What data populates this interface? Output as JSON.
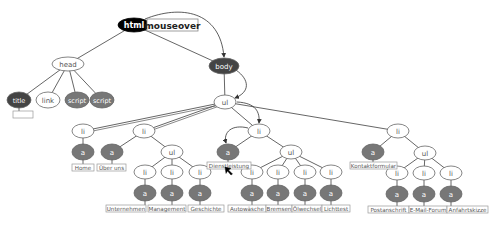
{
  "diagram": {
    "event_label": "mouseover",
    "colors": {
      "black": "#000000",
      "dark": "#444444",
      "medium": "#777777",
      "light": "#ffffff",
      "stroke": "#555555",
      "label_border": "#999999",
      "label_text": "#555555"
    },
    "nodes": [
      {
        "id": "html",
        "label": "html",
        "x": 134,
        "y": 25,
        "rx": 16,
        "ry": 7,
        "fill": "black"
      },
      {
        "id": "head",
        "label": "head",
        "x": 68,
        "y": 64,
        "rx": 16,
        "ry": 7,
        "fill": "light"
      },
      {
        "id": "body",
        "label": "body",
        "x": 224,
        "y": 66,
        "rx": 15,
        "ry": 8,
        "fill": "dark"
      },
      {
        "id": "title",
        "label": "title",
        "x": 19,
        "y": 100,
        "rx": 12,
        "ry": 8,
        "fill": "dark"
      },
      {
        "id": "link",
        "label": "link",
        "x": 48,
        "y": 100,
        "rx": 12,
        "ry": 8,
        "fill": "light"
      },
      {
        "id": "script1",
        "label": "script",
        "x": 77,
        "y": 100,
        "rx": 12,
        "ry": 8,
        "fill": "medium"
      },
      {
        "id": "script2",
        "label": "script",
        "x": 102,
        "y": 100,
        "rx": 12,
        "ry": 8,
        "fill": "medium"
      },
      {
        "id": "ul0",
        "label": "ul",
        "x": 225,
        "y": 102,
        "rx": 11,
        "ry": 7,
        "fill": "light"
      },
      {
        "id": "li1",
        "label": "li",
        "x": 83,
        "y": 131,
        "rx": 11,
        "ry": 7,
        "fill": "light"
      },
      {
        "id": "li2",
        "label": "li",
        "x": 144,
        "y": 131,
        "rx": 11,
        "ry": 7,
        "fill": "light"
      },
      {
        "id": "li3",
        "label": "li",
        "x": 259,
        "y": 131,
        "rx": 11,
        "ry": 7,
        "fill": "light"
      },
      {
        "id": "li4",
        "label": "li",
        "x": 398,
        "y": 131,
        "rx": 11,
        "ry": 7,
        "fill": "light"
      },
      {
        "id": "a_home",
        "label": "a",
        "x": 83,
        "y": 152,
        "rx": 11,
        "ry": 8,
        "fill": "medium"
      },
      {
        "id": "a_ueber",
        "label": "a",
        "x": 112,
        "y": 152,
        "rx": 11,
        "ry": 8,
        "fill": "medium"
      },
      {
        "id": "ul2",
        "label": "ul",
        "x": 172,
        "y": 152,
        "rx": 11,
        "ry": 7,
        "fill": "light"
      },
      {
        "id": "li2a",
        "label": "li",
        "x": 145,
        "y": 172,
        "rx": 11,
        "ry": 7,
        "fill": "light"
      },
      {
        "id": "li2b",
        "label": "li",
        "x": 172,
        "y": 172,
        "rx": 11,
        "ry": 7,
        "fill": "light"
      },
      {
        "id": "li2c",
        "label": "li",
        "x": 200,
        "y": 172,
        "rx": 11,
        "ry": 7,
        "fill": "light"
      },
      {
        "id": "a2a",
        "label": "a",
        "x": 145,
        "y": 193,
        "rx": 11,
        "ry": 8,
        "fill": "medium"
      },
      {
        "id": "a2b",
        "label": "a",
        "x": 172,
        "y": 193,
        "rx": 11,
        "ry": 8,
        "fill": "medium"
      },
      {
        "id": "a2c",
        "label": "a",
        "x": 200,
        "y": 193,
        "rx": 11,
        "ry": 8,
        "fill": "medium"
      },
      {
        "id": "a_dienst",
        "label": "a",
        "x": 228,
        "y": 152,
        "rx": 11,
        "ry": 8,
        "fill": "medium"
      },
      {
        "id": "ul3",
        "label": "ul",
        "x": 291,
        "y": 152,
        "rx": 11,
        "ry": 7,
        "fill": "light"
      },
      {
        "id": "li3a",
        "label": "li",
        "x": 252,
        "y": 172,
        "rx": 11,
        "ry": 7,
        "fill": "light"
      },
      {
        "id": "li3b",
        "label": "li",
        "x": 278,
        "y": 172,
        "rx": 11,
        "ry": 7,
        "fill": "light"
      },
      {
        "id": "li3c",
        "label": "li",
        "x": 305,
        "y": 172,
        "rx": 11,
        "ry": 7,
        "fill": "light"
      },
      {
        "id": "li3d",
        "label": "li",
        "x": 331,
        "y": 172,
        "rx": 11,
        "ry": 7,
        "fill": "light"
      },
      {
        "id": "a3a",
        "label": "a",
        "x": 252,
        "y": 193,
        "rx": 11,
        "ry": 8,
        "fill": "medium"
      },
      {
        "id": "a3b",
        "label": "a",
        "x": 278,
        "y": 193,
        "rx": 11,
        "ry": 8,
        "fill": "medium"
      },
      {
        "id": "a3c",
        "label": "a",
        "x": 305,
        "y": 193,
        "rx": 11,
        "ry": 8,
        "fill": "medium"
      },
      {
        "id": "a3d",
        "label": "a",
        "x": 331,
        "y": 193,
        "rx": 11,
        "ry": 8,
        "fill": "medium"
      },
      {
        "id": "a_kontakt",
        "label": "a",
        "x": 373,
        "y": 152,
        "rx": 11,
        "ry": 8,
        "fill": "medium"
      },
      {
        "id": "ul4",
        "label": "ul",
        "x": 425,
        "y": 153,
        "rx": 11,
        "ry": 7,
        "fill": "light"
      },
      {
        "id": "li4a",
        "label": "li",
        "x": 397,
        "y": 173,
        "rx": 11,
        "ry": 7,
        "fill": "light"
      },
      {
        "id": "li4b",
        "label": "li",
        "x": 424,
        "y": 173,
        "rx": 11,
        "ry": 7,
        "fill": "light"
      },
      {
        "id": "li4c",
        "label": "li",
        "x": 451,
        "y": 173,
        "rx": 11,
        "ry": 7,
        "fill": "light"
      },
      {
        "id": "a4a",
        "label": "a",
        "x": 397,
        "y": 194,
        "rx": 11,
        "ry": 8,
        "fill": "medium"
      },
      {
        "id": "a4b",
        "label": "a",
        "x": 424,
        "y": 194,
        "rx": 11,
        "ry": 8,
        "fill": "medium"
      },
      {
        "id": "a4c",
        "label": "a",
        "x": 451,
        "y": 194,
        "rx": 11,
        "ry": 8,
        "fill": "medium"
      }
    ],
    "edges": [
      [
        "html",
        "head"
      ],
      [
        "html",
        "body"
      ],
      [
        "head",
        "title"
      ],
      [
        "head",
        "link"
      ],
      [
        "head",
        "script1"
      ],
      [
        "head",
        "script2"
      ],
      [
        "body",
        "ul0"
      ],
      [
        "ul0",
        "li1"
      ],
      [
        "ul0",
        "li2"
      ],
      [
        "ul0",
        "li3"
      ],
      [
        "ul0",
        "li4"
      ],
      [
        "li1",
        "a_home"
      ],
      [
        "li2",
        "a_ueber"
      ],
      [
        "li2",
        "ul2"
      ],
      [
        "ul2",
        "li2a"
      ],
      [
        "ul2",
        "li2b"
      ],
      [
        "ul2",
        "li2c"
      ],
      [
        "li2a",
        "a2a"
      ],
      [
        "li2b",
        "a2b"
      ],
      [
        "li2c",
        "a2c"
      ],
      [
        "li3",
        "a_dienst"
      ],
      [
        "li3",
        "ul3"
      ],
      [
        "ul3",
        "li3a"
      ],
      [
        "ul3",
        "li3b"
      ],
      [
        "ul3",
        "li3c"
      ],
      [
        "ul3",
        "li3d"
      ],
      [
        "li3a",
        "a3a"
      ],
      [
        "li3b",
        "a3b"
      ],
      [
        "li3c",
        "a3c"
      ],
      [
        "li3d",
        "a3d"
      ],
      [
        "li4",
        "a_kontakt"
      ],
      [
        "li4",
        "ul4"
      ],
      [
        "ul4",
        "li4a"
      ],
      [
        "ul4",
        "li4b"
      ],
      [
        "ul4",
        "li4c"
      ],
      [
        "li4a",
        "a4a"
      ],
      [
        "li4b",
        "a4b"
      ],
      [
        "li4c",
        "a4c"
      ]
    ],
    "text_labels": [
      {
        "parent": "title",
        "text": "",
        "x": 13,
        "y": 111,
        "w": 20,
        "h": 7
      },
      {
        "parent": "a_home",
        "text": "Home",
        "x": 72,
        "y": 164,
        "w": 22,
        "h": 7
      },
      {
        "parent": "a_ueber",
        "text": "Über uns",
        "x": 97,
        "y": 164,
        "w": 29,
        "h": 7
      },
      {
        "parent": "a2a",
        "text": "Unternehmen",
        "x": 106,
        "y": 205,
        "w": 40,
        "h": 7
      },
      {
        "parent": "a2b",
        "text": "Management",
        "x": 148,
        "y": 205,
        "w": 38,
        "h": 7
      },
      {
        "parent": "a2c",
        "text": "Geschichte",
        "x": 188,
        "y": 205,
        "w": 36,
        "h": 7
      },
      {
        "parent": "a_dienst",
        "text": "Dienstleistung",
        "x": 207,
        "y": 162,
        "w": 44,
        "h": 7
      },
      {
        "parent": "a3a",
        "text": "Autowäsche",
        "x": 228,
        "y": 205,
        "w": 38,
        "h": 7
      },
      {
        "parent": "a3b",
        "text": "Bremsen",
        "x": 266,
        "y": 205,
        "w": 26,
        "h": 7
      },
      {
        "parent": "a3c",
        "text": "Ölwechsel",
        "x": 292,
        "y": 205,
        "w": 30,
        "h": 7
      },
      {
        "parent": "a3d",
        "text": "Lichttest",
        "x": 322,
        "y": 205,
        "w": 28,
        "h": 7
      },
      {
        "parent": "a_kontakt",
        "text": "Kontaktformular",
        "x": 350,
        "y": 162,
        "w": 47,
        "h": 7
      },
      {
        "parent": "a4a",
        "text": "Postanschrift",
        "x": 368,
        "y": 206,
        "w": 41,
        "h": 7
      },
      {
        "parent": "a4b",
        "text": "E-Mail-Forum",
        "x": 409,
        "y": 206,
        "w": 38,
        "h": 7
      },
      {
        "parent": "a4c",
        "text": "Anfahrtskizze",
        "x": 447,
        "y": 206,
        "w": 41,
        "h": 7
      }
    ],
    "event_arrows": [
      {
        "from": "html",
        "to": "body",
        "d": "M145,19 C180,5 220,10 224,57"
      },
      {
        "from": "body",
        "to": "ul0",
        "d": "M236,70 C250,80 250,92 235,98"
      },
      {
        "from": "ul0",
        "to": "li3",
        "d": "M237,102 C256,103 260,112 259,123"
      },
      {
        "from": "li3",
        "to": "a_dienst",
        "d": "M248,128 C232,124 223,132 226,143"
      }
    ],
    "cursor": {
      "x": 225,
      "y": 167
    }
  }
}
